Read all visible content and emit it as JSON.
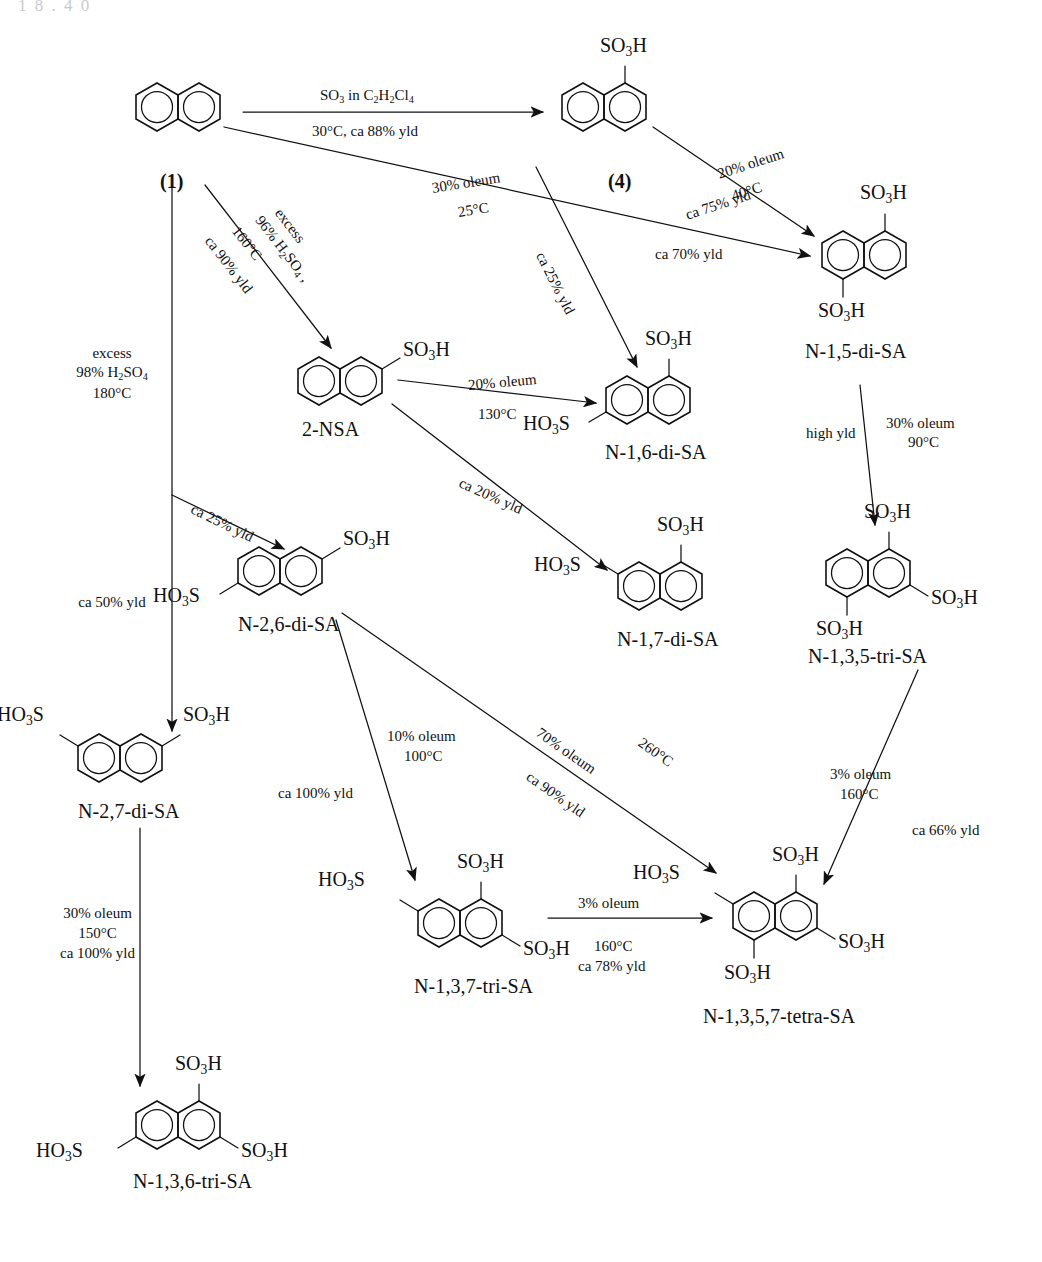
{
  "figure": {
    "type": "reaction-scheme",
    "cut_header": "1 8 . 4 0"
  },
  "compounds": [
    {
      "id": "naphthalene",
      "label": "(1)",
      "substituents": []
    },
    {
      "id": "n1sa",
      "label": "(4)",
      "substituents": [
        "SO3H"
      ]
    },
    {
      "id": "n15disa",
      "label": "N-1,5-di-SA",
      "substituents": [
        "SO3H",
        "SO3H"
      ]
    },
    {
      "id": "n2nsa",
      "label": "2-NSA",
      "substituents": [
        "SO3H"
      ]
    },
    {
      "id": "n16disa",
      "label": "N-1,6-di-SA",
      "substituents": [
        "SO3H",
        "HO3S"
      ]
    },
    {
      "id": "n26disa",
      "label": "N-2,6-di-SA",
      "substituents": [
        "SO3H",
        "HO3S"
      ]
    },
    {
      "id": "n17disa",
      "label": "N-1,7-di-SA",
      "substituents": [
        "SO3H",
        "HO3S"
      ]
    },
    {
      "id": "n135trisa",
      "label": "N-1,3,5-tri-SA",
      "substituents": [
        "SO3H",
        "SO3H",
        "SO3H"
      ]
    },
    {
      "id": "n27disa",
      "label": "N-2,7-di-SA",
      "substituents": [
        "HO3S",
        "SO3H"
      ]
    },
    {
      "id": "n137trisa",
      "label": "N-1,3,7-tri-SA",
      "substituents": [
        "HO3S",
        "SO3H",
        "SO3H"
      ]
    },
    {
      "id": "n1357tetrasa",
      "label": "N-1,3,5,7-tetra-SA",
      "substituents": [
        "HO3S",
        "SO3H",
        "SO3H",
        "SO3H"
      ]
    },
    {
      "id": "n136trisa",
      "label": "N-1,3,6-tri-SA",
      "substituents": [
        "HO3S",
        "SO3H",
        "SO3H"
      ]
    }
  ],
  "group_labels": {
    "so3h": "SO3H",
    "ho3s": "HO3S"
  },
  "reactions": [
    {
      "id": "r1",
      "from": "naphthalene",
      "to": "n1sa",
      "reagent": "SO3 in C2H2Cl4",
      "conditions": "30°C, ca 88% yld",
      "yield": "ca 88% yld"
    },
    {
      "id": "r2",
      "from": "naphthalene",
      "to": "n15disa",
      "reagent": "30% oleum",
      "conditions": "25°C",
      "yield": "ca 70% yld"
    },
    {
      "id": "r3",
      "from": "naphthalene",
      "to": "n16disa",
      "reagent": "",
      "conditions": "",
      "yield": "ca 25% yld"
    },
    {
      "id": "r4",
      "from": "naphthalene",
      "to": "n2nsa",
      "reagent": "excess 96% H2SO4",
      "conditions": "160°C",
      "yield": "ca 90% yld"
    },
    {
      "id": "r5",
      "from": "naphthalene",
      "to": "n27disa",
      "reagent": "excess 98% H2SO4",
      "conditions": "180°C",
      "yield": "ca 50% yld"
    },
    {
      "id": "r6",
      "from": "naphthalene",
      "to": "n26disa",
      "reagent": "",
      "conditions": "",
      "yield": "ca 25% yld"
    },
    {
      "id": "r7",
      "from": "n1sa",
      "to": "n15disa",
      "reagent": "20% oleum",
      "conditions": "40°C",
      "yield": "ca 75% yld"
    },
    {
      "id": "r8",
      "from": "n2nsa",
      "to": "n16disa",
      "reagent": "20% oleum",
      "conditions": "130°C",
      "yield": ""
    },
    {
      "id": "r9",
      "from": "n2nsa",
      "to": "n17disa",
      "reagent": "",
      "conditions": "",
      "yield": "ca 20% yld"
    },
    {
      "id": "r10",
      "from": "n15disa",
      "to": "n135trisa",
      "reagent": "30% oleum",
      "conditions": "90°C",
      "yield": "high yld"
    },
    {
      "id": "r11",
      "from": "n26disa",
      "to": "n137trisa",
      "reagent": "10% oleum",
      "conditions": "100°C",
      "yield": "ca 100% yld"
    },
    {
      "id": "r12",
      "from": "n26disa",
      "to": "n1357tetrasa",
      "reagent": "70% oleum",
      "conditions": "260°C",
      "yield": "ca 90% yld"
    },
    {
      "id": "r13",
      "from": "n137trisa",
      "to": "n1357tetrasa",
      "reagent": "3% oleum",
      "conditions": "160°C",
      "yield": "ca 78% yld"
    },
    {
      "id": "r14",
      "from": "n135trisa",
      "to": "n1357tetrasa",
      "reagent": "3% oleum",
      "conditions": "160°C",
      "yield": "ca 66% yld"
    },
    {
      "id": "r15",
      "from": "n27disa",
      "to": "n136trisa",
      "reagent": "30%  oleum",
      "conditions": "150°C",
      "yield": "ca 100% yld"
    }
  ],
  "annotations": {
    "a_r1_top": "SO3 in C2H2Cl4",
    "a_r1_bottom": "30°C, ca 88% yld",
    "a_r2_line1": "30% oleum",
    "a_r2_line2": "25°C",
    "a_r2_yield": "ca 70% yld",
    "a_r3_yield": "ca 25% yld",
    "a_r4_line1": "excess",
    "a_r4_line2": "96% H2SO4 ,",
    "a_r4_line3": "160°C",
    "a_r4_line4": "ca 90% yld",
    "a_r5_line1": "excess",
    "a_r5_line2": "98% H2SO4",
    "a_r5_line3": "180°C",
    "a_r5_yield": "ca 50% yld",
    "a_r6_yield": "ca 25% yld",
    "a_r7_line1": "20% oleum",
    "a_r7_line2": "40°C",
    "a_r7_line3": "ca 75% yld",
    "a_r8_line1": "20% oleum",
    "a_r8_line2": "130°C",
    "a_r9_yield": "ca 20% yld",
    "a_r10_yield": "high yld",
    "a_r10_line1": "30% oleum",
    "a_r10_line2": "90°C",
    "a_r11_line1": "10% oleum",
    "a_r11_line2": "100°C",
    "a_r11_line3": "ca 100% yld",
    "a_r12_line1": "70% oleum",
    "a_r12_line2": "260°C",
    "a_r12_line3": "ca 90% yld",
    "a_r13_line1": "3% oleum",
    "a_r13_line2": "160°C",
    "a_r13_line3": "ca 78% yld",
    "a_r14_line1": "3% oleum",
    "a_r14_line2": "160°C",
    "a_r14_line3": "ca 66% yld",
    "a_r15_line1": "30%  oleum",
    "a_r15_line2": "150°C",
    "a_r15_line3": "ca 100% yld"
  },
  "colors": {
    "ink": "#111111",
    "background": "#ffffff",
    "cut_header": "#c9c9d2"
  }
}
